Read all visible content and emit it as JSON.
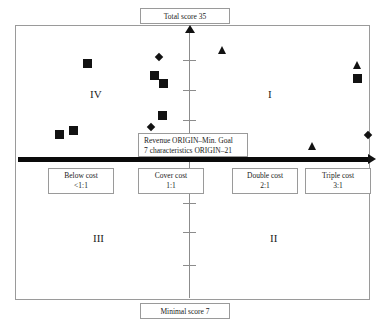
{
  "chart_data": {
    "type": "scatter",
    "title": "",
    "xlabel": "Revenue / cost ratio",
    "ylabel": "Total score",
    "axis": {
      "y_top_label": "Total score 35",
      "y_bottom_label": "Minimal score 7",
      "y_max": 35,
      "y_min": 7,
      "x_origin_note": "Revenue ORIGIN-Min. Goal",
      "x_origin_note2": "7 characteristics ORIGIN-21",
      "grid": false,
      "legend": "none"
    },
    "x_categories": [
      {
        "label": "Below cost",
        "ratio": "<1:1"
      },
      {
        "label": "Cover cost",
        "ratio": "1:1"
      },
      {
        "label": "Double cost",
        "ratio": "2:1"
      },
      {
        "label": "Triple cost",
        "ratio": "3:1"
      }
    ],
    "quadrants": [
      {
        "name": "I",
        "position": "top-right"
      },
      {
        "name": "II",
        "position": "bottom-right"
      },
      {
        "name": "III",
        "position": "bottom-left"
      },
      {
        "name": "IV",
        "position": "top-left"
      }
    ],
    "series": [
      {
        "name": "square",
        "marker": "square",
        "points": [
          {
            "px": 87,
            "py": 63
          },
          {
            "px": 154,
            "py": 75
          },
          {
            "px": 163,
            "py": 83
          },
          {
            "px": 162,
            "py": 115
          },
          {
            "px": 73,
            "py": 130
          },
          {
            "px": 59,
            "py": 134
          },
          {
            "px": 357,
            "py": 78
          }
        ]
      },
      {
        "name": "diamond",
        "marker": "diamond",
        "points": [
          {
            "px": 159,
            "py": 57
          },
          {
            "px": 151,
            "py": 127
          },
          {
            "px": 368,
            "py": 135
          }
        ]
      },
      {
        "name": "triangle",
        "marker": "triangle",
        "points": [
          {
            "px": 222,
            "py": 50
          },
          {
            "px": 357,
            "py": 65
          },
          {
            "px": 312,
            "py": 146
          }
        ]
      }
    ]
  },
  "labels": {
    "top": "Total score 35",
    "bottom": "Minimal score 7",
    "center_line1": "Revenue ORIGIN–Min. Goal",
    "center_line2": "7 characteristics ORIGIN–21"
  },
  "cost_boxes": [
    {
      "name": "Below cost",
      "ratio": "<1:1"
    },
    {
      "name": "Cover cost",
      "ratio": "1:1"
    },
    {
      "name": "Double cost",
      "ratio": "2:1"
    },
    {
      "name": "Triple cost",
      "ratio": "3:1"
    }
  ],
  "quadrant_labels": {
    "one": "I",
    "two": "II",
    "three": "III",
    "four": "IV"
  },
  "y_ticks": [
    60,
    90,
    120,
    203,
    232,
    265
  ],
  "colors": {
    "marker": "#121212",
    "axis": "#8c8c8c",
    "frame": "#9a9a9a",
    "haxis": "#0a0a0a"
  }
}
